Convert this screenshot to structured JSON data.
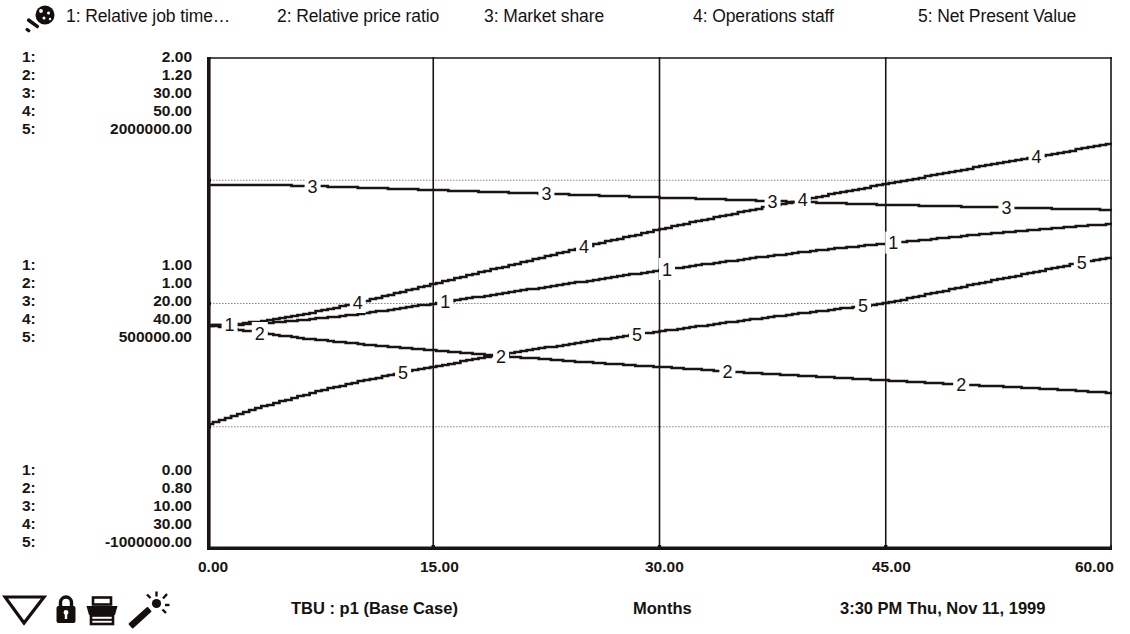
{
  "window": {
    "title": "Model Output Graph"
  },
  "toolbar_top": {
    "icon": "magnifier-icon"
  },
  "legend": {
    "entries": [
      {
        "num": "1:",
        "label": "Relative job time…",
        "icon": "series-1-marker"
      },
      {
        "num": "2:",
        "label": "Relative price ratio",
        "icon": "series-2-marker"
      },
      {
        "num": "3:",
        "label": "Market share",
        "icon": "series-3-marker"
      },
      {
        "num": "4:",
        "label": "Operations staff",
        "icon": "series-4-marker"
      },
      {
        "num": "5:",
        "label": "Net Present Value",
        "icon": "series-5-marker"
      }
    ]
  },
  "y_axis": {
    "top_block": {
      "keys": [
        "1:",
        "2:",
        "3:",
        "4:",
        "5:"
      ],
      "values": [
        "2.00",
        "1.20",
        "30.00",
        "50.00",
        "2000000.00"
      ]
    },
    "mid_block": {
      "keys": [
        "1:",
        "2:",
        "3:",
        "4:",
        "5:"
      ],
      "values": [
        "1.00",
        "1.00",
        "20.00",
        "40.00",
        "500000.00"
      ]
    },
    "bottom_block": {
      "keys": [
        "1:",
        "2:",
        "3:",
        "4:",
        "5:"
      ],
      "values": [
        "0.00",
        "0.80",
        "10.00",
        "30.00",
        "-1000000.00"
      ]
    }
  },
  "x_axis": {
    "label": "Months",
    "ticks": [
      "0.00",
      "15.00",
      "30.00",
      "45.00",
      "60.00"
    ]
  },
  "footer": {
    "model_run": "TBU : p1 (Base Case)",
    "time": "3:30 PM",
    "date": "Thu, Nov 11, 1999",
    "timestamp": "3:30 PM   Thu, Nov 11, 1999",
    "icons": [
      "zoom-out-icon",
      "lock-icon",
      "print-icon",
      "magic-wand-icon"
    ]
  },
  "colors": {
    "ink": "#1a1512",
    "grid": "#8d8d8d",
    "background": "#ffffff"
  },
  "chart_data": {
    "type": "line",
    "title": "TBU : p1 (Base Case)",
    "xlabel": "Months",
    "ylabel": "",
    "xlim": [
      0,
      60
    ],
    "xticks": [
      0,
      15,
      30,
      45,
      60
    ],
    "grid": true,
    "gridlines_y_fraction": [
      0.25,
      0.5,
      0.75
    ],
    "legend_position": "top",
    "axes": [
      {
        "id": 1,
        "name": "Relative job time…",
        "min": 0.0,
        "mid": 1.0,
        "max": 2.0
      },
      {
        "id": 2,
        "name": "Relative price ratio",
        "min": 0.8,
        "mid": 1.0,
        "max": 1.2
      },
      {
        "id": 3,
        "name": "Market share",
        "min": 10.0,
        "mid": 20.0,
        "max": 30.0
      },
      {
        "id": 4,
        "name": "Operations staff",
        "min": 30.0,
        "mid": 40.0,
        "max": 50.0
      },
      {
        "id": 5,
        "name": "Net Present Value",
        "min": -1000000.0,
        "mid": 500000.0,
        "max": 2000000.0
      }
    ],
    "series": [
      {
        "name": "Relative job time…",
        "id": 1,
        "label_positions_months": [
          1.5,
          15.8,
          30.5,
          45.5
        ],
        "x": [
          0,
          2,
          4,
          6,
          8,
          10,
          12,
          14,
          16,
          18,
          20,
          22,
          24,
          26,
          28,
          30,
          33,
          36,
          39,
          42,
          45,
          48,
          51,
          54,
          57,
          60
        ],
        "values_fraction": [
          0.455,
          0.457,
          0.461,
          0.466,
          0.472,
          0.479,
          0.487,
          0.496,
          0.505,
          0.514,
          0.523,
          0.532,
          0.541,
          0.55,
          0.559,
          0.568,
          0.58,
          0.592,
          0.603,
          0.613,
          0.622,
          0.631,
          0.64,
          0.648,
          0.655,
          0.662
        ]
      },
      {
        "name": "Relative price ratio",
        "id": 2,
        "label_positions_months": [
          3.5,
          19.5,
          34.5,
          50.0
        ],
        "x": [
          0,
          2,
          4,
          6,
          8,
          10,
          12,
          14,
          16,
          18,
          20,
          22,
          24,
          26,
          28,
          30,
          33,
          36,
          39,
          42,
          45,
          48,
          51,
          54,
          57,
          60
        ],
        "values_fraction": [
          0.455,
          0.447,
          0.438,
          0.43,
          0.424,
          0.418,
          0.412,
          0.407,
          0.402,
          0.397,
          0.392,
          0.388,
          0.383,
          0.379,
          0.375,
          0.371,
          0.365,
          0.359,
          0.354,
          0.349,
          0.344,
          0.339,
          0.334,
          0.329,
          0.324,
          0.318
        ]
      },
      {
        "name": "Market share",
        "id": 3,
        "label_positions_months": [
          7.0,
          22.5,
          37.5,
          53.0
        ],
        "x": [
          0,
          2,
          4,
          6,
          8,
          10,
          12,
          14,
          16,
          18,
          20,
          22,
          24,
          26,
          28,
          30,
          33,
          36,
          39,
          42,
          45,
          48,
          51,
          54,
          57,
          60
        ],
        "values_fraction": [
          0.741,
          0.741,
          0.74,
          0.739,
          0.737,
          0.735,
          0.733,
          0.731,
          0.729,
          0.727,
          0.725,
          0.723,
          0.721,
          0.719,
          0.717,
          0.715,
          0.712,
          0.709,
          0.706,
          0.703,
          0.7,
          0.698,
          0.696,
          0.694,
          0.692,
          0.69
        ]
      },
      {
        "name": "Operations staff",
        "id": 4,
        "label_positions_months": [
          10.0,
          25.0,
          39.5,
          55.0
        ],
        "x": [
          0,
          2,
          4,
          6,
          8,
          10,
          12,
          14,
          16,
          18,
          20,
          22,
          24,
          26,
          28,
          30,
          33,
          36,
          39,
          42,
          45,
          48,
          51,
          54,
          57,
          60
        ],
        "values_fraction": [
          0.456,
          0.459,
          0.466,
          0.476,
          0.489,
          0.503,
          0.518,
          0.533,
          0.548,
          0.563,
          0.578,
          0.593,
          0.608,
          0.623,
          0.637,
          0.651,
          0.671,
          0.69,
          0.708,
          0.726,
          0.743,
          0.76,
          0.777,
          0.793,
          0.809,
          0.826
        ]
      },
      {
        "name": "Net Present Value",
        "id": 5,
        "label_positions_months": [
          13.0,
          28.5,
          43.5,
          58.0
        ],
        "x": [
          0,
          2,
          4,
          6,
          8,
          10,
          12,
          14,
          16,
          18,
          20,
          22,
          24,
          26,
          28,
          30,
          33,
          36,
          39,
          42,
          45,
          48,
          51,
          54,
          57,
          60
        ],
        "values_fraction": [
          0.255,
          0.276,
          0.295,
          0.312,
          0.328,
          0.342,
          0.355,
          0.367,
          0.378,
          0.389,
          0.399,
          0.409,
          0.418,
          0.427,
          0.436,
          0.444,
          0.456,
          0.468,
          0.479,
          0.49,
          0.501,
          0.521,
          0.541,
          0.559,
          0.578,
          0.595
        ]
      }
    ]
  }
}
